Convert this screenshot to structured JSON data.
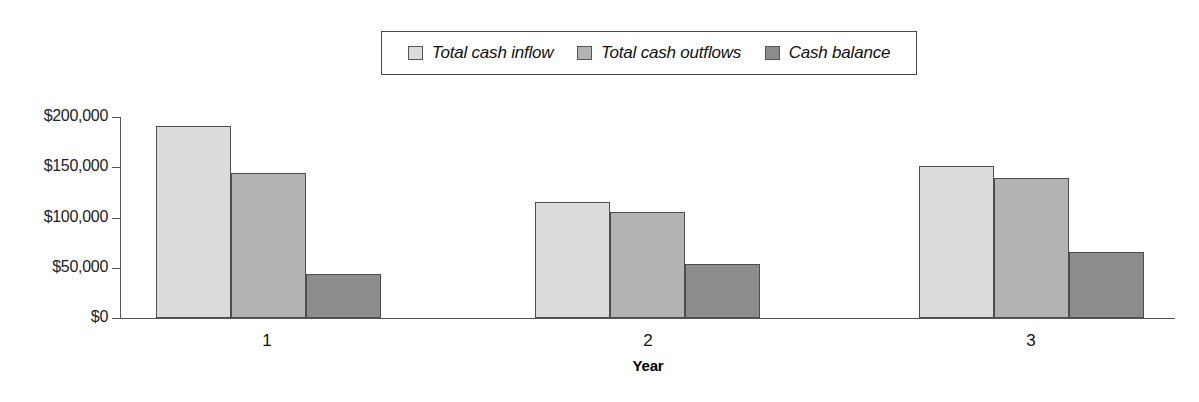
{
  "chart_data": {
    "type": "bar",
    "title": "",
    "subtitle": "",
    "xlabel": "Year",
    "ylabel": "",
    "categories": [
      "1",
      "2",
      "3"
    ],
    "series": [
      {
        "name": "Total cash inflow",
        "color": "#dcdcdc",
        "values": [
          191000,
          115000,
          151000
        ]
      },
      {
        "name": "Total cash outflows",
        "color": "#b3b3b3",
        "values": [
          144000,
          105000,
          139000
        ]
      },
      {
        "name": "Cash balance",
        "color": "#8c8c8c",
        "values": [
          44000,
          54000,
          66000
        ]
      }
    ],
    "ylim": [
      0,
      200000
    ],
    "ytick_labels": [
      "$200,000",
      "$150,000",
      "$100,000",
      "$50,000",
      "$0"
    ],
    "ytick_values": [
      200000,
      150000,
      100000,
      50000,
      0
    ],
    "grid": false,
    "legend_position": "top-center",
    "legend_italic": true
  },
  "legend": {
    "items": [
      {
        "label": "Total cash inflow",
        "swatch_color": "#dcdcdc"
      },
      {
        "label": "Total cash outflows",
        "swatch_color": "#b3b3b3"
      },
      {
        "label": "Cash balance",
        "swatch_color": "#8c8c8c"
      }
    ]
  },
  "axes": {
    "y_labels": [
      "$200,000",
      "$150,000",
      "$100,000",
      "$50,000",
      "$0"
    ],
    "x_labels": [
      "1",
      "2",
      "3"
    ],
    "x_title": "Year"
  },
  "colors": {
    "axis": "#555555",
    "bar_border": "#4d4d4d",
    "background": "#ffffff",
    "series_1": "#dcdcdc",
    "series_2": "#b3b3b3",
    "series_3": "#8c8c8c"
  }
}
